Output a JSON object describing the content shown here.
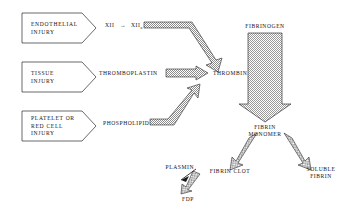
{
  "diagram": {
    "type": "flow-diagram",
    "background_color": "#ffffff",
    "stroke_color": "#1a1a1a",
    "fill_pattern": "stipple-checker",
    "fill_color": "#d8d8d8"
  },
  "injury_boxes": [
    {
      "id": "endothelial",
      "line1": "ENDOTHELIAL",
      "line2": "INJURY",
      "line3": ""
    },
    {
      "id": "tissue",
      "line1": "TISSUE",
      "line2": "INJURY",
      "line3": ""
    },
    {
      "id": "platelet",
      "line1": "PLATELET OR",
      "line2": "RED CELL",
      "line3": "INJURY"
    }
  ],
  "factors": {
    "factor_xii": "XII",
    "arrow_glyph": "→",
    "factor_xiia_base": "XII",
    "factor_xiia_sub": "a",
    "thromboplastin": "THROMBOPLASTIN",
    "phospholipid": "PHOSPHOLIPID",
    "thrombin": "THROMBIN",
    "fibrinogen": "FIBRINOGEN",
    "fibrin_monomer_line1": "FIBRIN",
    "fibrin_monomer_line2": "MONOMER",
    "fibrin_clot": "FIBRIN CLOT",
    "soluble_fibrin_line1": "SOLUBLE",
    "soluble_fibrin_line2": "FIBRIN",
    "plasmin": "PLASMIN",
    "fdp": "FDP"
  },
  "arrows": [
    {
      "id": "xiia-to-thrombin",
      "from": "XIIa",
      "to": "THROMBIN",
      "style": "bent-block"
    },
    {
      "id": "thromboplastin-to-thrombin",
      "from": "THROMBOPLASTIN",
      "to": "THROMBIN",
      "style": "horizontal-block"
    },
    {
      "id": "phospholipid-to-thrombin",
      "from": "PHOSPHOLIPID",
      "to": "THROMBIN",
      "style": "bent-block-up"
    },
    {
      "id": "fibrinogen-to-monomer",
      "from": "FIBRINOGEN",
      "to": "FIBRIN MONOMER",
      "style": "wide-down-block"
    },
    {
      "id": "monomer-to-clot",
      "from": "FIBRIN MONOMER",
      "to": "FIBRIN CLOT",
      "style": "diagonal-block"
    },
    {
      "id": "monomer-to-soluble",
      "from": "FIBRIN MONOMER",
      "to": "SOLUBLE FIBRIN",
      "style": "diagonal-block"
    },
    {
      "id": "clot-to-fdp",
      "from": "FIBRIN CLOT",
      "to": "FDP",
      "style": "small-diagonal-block"
    },
    {
      "id": "plasmin-to-fdp",
      "from": "PLASMIN",
      "to": "FDP",
      "style": "thin-line"
    }
  ]
}
